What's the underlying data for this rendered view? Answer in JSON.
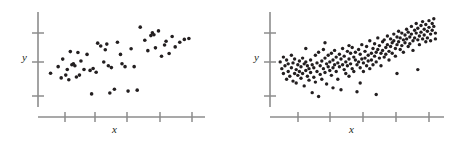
{
  "figure": {
    "title": "",
    "background": "#ffffff",
    "point_color": "#231f20",
    "axis_color": "#8c8c8c"
  },
  "chart_data": [
    {
      "type": "scatter",
      "name": "left-panel",
      "title": "",
      "xlabel": "x",
      "ylabel": "y",
      "xlim": [
        0,
        100
      ],
      "ylim": [
        0,
        100
      ],
      "grid": false,
      "legend": null,
      "n_points": 55,
      "x_ticks": [
        16,
        33,
        50,
        67,
        84
      ],
      "x_tick_labels": [
        "",
        "",
        "",
        "",
        ""
      ],
      "y_ticks": [
        22,
        52,
        82
      ],
      "y_tick_labels": [
        "",
        "",
        ""
      ],
      "points": [
        [
          3,
          37
        ],
        [
          8,
          44
        ],
        [
          10,
          32
        ],
        [
          11,
          52
        ],
        [
          13,
          35
        ],
        [
          14,
          41
        ],
        [
          15,
          30
        ],
        [
          16,
          60
        ],
        [
          17,
          46
        ],
        [
          18,
          47
        ],
        [
          19,
          45
        ],
        [
          20,
          33
        ],
        [
          21,
          59
        ],
        [
          22,
          35
        ],
        [
          23,
          50
        ],
        [
          25,
          41
        ],
        [
          27,
          57
        ],
        [
          29,
          40
        ],
        [
          30,
          15
        ],
        [
          31,
          42
        ],
        [
          33,
          38
        ],
        [
          34,
          69
        ],
        [
          36,
          66
        ],
        [
          38,
          49
        ],
        [
          39,
          62
        ],
        [
          40,
          68
        ],
        [
          41,
          45
        ],
        [
          42,
          16
        ],
        [
          43,
          43
        ],
        [
          45,
          20
        ],
        [
          47,
          70
        ],
        [
          49,
          57
        ],
        [
          50,
          47
        ],
        [
          52,
          44
        ],
        [
          54,
          18
        ],
        [
          56,
          63
        ],
        [
          58,
          44
        ],
        [
          60,
          19
        ],
        [
          62,
          86
        ],
        [
          65,
          72
        ],
        [
          67,
          61
        ],
        [
          69,
          77
        ],
        [
          70,
          80
        ],
        [
          71,
          78
        ],
        [
          72,
          64
        ],
        [
          74,
          82
        ],
        [
          76,
          55
        ],
        [
          78,
          67
        ],
        [
          79,
          71
        ],
        [
          81,
          58
        ],
        [
          83,
          76
        ],
        [
          85,
          65
        ],
        [
          88,
          70
        ],
        [
          91,
          73
        ],
        [
          94,
          74
        ]
      ]
    },
    {
      "type": "scatter",
      "name": "right-panel",
      "title": "",
      "xlabel": "x",
      "ylabel": "y",
      "xlim": [
        0,
        100
      ],
      "ylim": [
        0,
        100
      ],
      "grid": false,
      "legend": null,
      "n_points": 200,
      "x_ticks": [
        16,
        33,
        50,
        67,
        84
      ],
      "x_tick_labels": [
        "",
        "",
        "",
        "",
        ""
      ],
      "y_ticks": [
        22,
        52,
        82
      ],
      "y_tick_labels": [
        "",
        "",
        ""
      ],
      "points": [
        [
          2,
          48
        ],
        [
          3,
          41
        ],
        [
          4,
          36
        ],
        [
          4,
          53
        ],
        [
          5,
          44
        ],
        [
          6,
          30
        ],
        [
          6,
          50
        ],
        [
          7,
          38
        ],
        [
          7,
          46
        ],
        [
          8,
          33
        ],
        [
          9,
          42
        ],
        [
          9,
          55
        ],
        [
          10,
          28
        ],
        [
          10,
          47
        ],
        [
          11,
          36
        ],
        [
          11,
          51
        ],
        [
          12,
          40
        ],
        [
          12,
          26
        ],
        [
          13,
          45
        ],
        [
          13,
          34
        ],
        [
          14,
          49
        ],
        [
          14,
          38
        ],
        [
          15,
          31
        ],
        [
          15,
          43
        ],
        [
          16,
          52
        ],
        [
          16,
          36
        ],
        [
          17,
          46
        ],
        [
          17,
          23
        ],
        [
          18,
          39
        ],
        [
          18,
          48
        ],
        [
          19,
          33
        ],
        [
          19,
          44
        ],
        [
          20,
          41
        ],
        [
          20,
          29
        ],
        [
          21,
          50
        ],
        [
          21,
          37
        ],
        [
          22,
          16
        ],
        [
          22,
          45
        ],
        [
          23,
          32
        ],
        [
          23,
          42
        ],
        [
          24,
          55
        ],
        [
          24,
          27
        ],
        [
          25,
          47
        ],
        [
          25,
          38
        ],
        [
          26,
          12
        ],
        [
          26,
          58
        ],
        [
          27,
          44
        ],
        [
          27,
          35
        ],
        [
          28,
          49
        ],
        [
          28,
          30
        ],
        [
          29,
          41
        ],
        [
          29,
          61
        ],
        [
          30,
          52
        ],
        [
          30,
          37
        ],
        [
          31,
          46
        ],
        [
          31,
          25
        ],
        [
          32,
          43
        ],
        [
          32,
          55
        ],
        [
          33,
          39
        ],
        [
          33,
          48
        ],
        [
          34,
          57
        ],
        [
          34,
          34
        ],
        [
          35,
          50
        ],
        [
          35,
          42
        ],
        [
          36,
          60
        ],
        [
          36,
          45
        ],
        [
          37,
          38
        ],
        [
          37,
          53
        ],
        [
          38,
          47
        ],
        [
          38,
          30
        ],
        [
          39,
          56
        ],
        [
          39,
          43
        ],
        [
          40,
          19
        ],
        [
          40,
          51
        ],
        [
          41,
          45
        ],
        [
          41,
          62
        ],
        [
          42,
          40
        ],
        [
          42,
          54
        ],
        [
          43,
          48
        ],
        [
          43,
          36
        ],
        [
          44,
          59
        ],
        [
          44,
          44
        ],
        [
          45,
          51
        ],
        [
          45,
          33
        ],
        [
          46,
          57
        ],
        [
          46,
          46
        ],
        [
          47,
          41
        ],
        [
          47,
          63
        ],
        [
          48,
          53
        ],
        [
          48,
          38
        ],
        [
          49,
          50
        ],
        [
          49,
          58
        ],
        [
          50,
          45
        ],
        [
          50,
          17
        ],
        [
          51,
          61
        ],
        [
          51,
          48
        ],
        [
          52,
          42
        ],
        [
          52,
          56
        ],
        [
          53,
          51
        ],
        [
          53,
          66
        ],
        [
          54,
          47
        ],
        [
          54,
          38
        ],
        [
          55,
          59
        ],
        [
          55,
          52
        ],
        [
          56,
          44
        ],
        [
          56,
          64
        ],
        [
          57,
          55
        ],
        [
          57,
          49
        ],
        [
          58,
          41
        ],
        [
          58,
          70
        ],
        [
          59,
          57
        ],
        [
          59,
          50
        ],
        [
          60,
          62
        ],
        [
          60,
          45
        ],
        [
          61,
          54
        ],
        [
          61,
          67
        ],
        [
          62,
          58
        ],
        [
          62,
          48
        ],
        [
          63,
          73
        ],
        [
          63,
          61
        ],
        [
          64,
          52
        ],
        [
          64,
          65
        ],
        [
          65,
          57
        ],
        [
          65,
          44
        ],
        [
          66,
          69
        ],
        [
          66,
          60
        ],
        [
          67,
          53
        ],
        [
          67,
          71
        ],
        [
          68,
          63
        ],
        [
          68,
          56
        ],
        [
          69,
          75
        ],
        [
          69,
          66
        ],
        [
          70,
          59
        ],
        [
          70,
          50
        ],
        [
          71,
          72
        ],
        [
          71,
          64
        ],
        [
          72,
          68
        ],
        [
          72,
          57
        ],
        [
          73,
          77
        ],
        [
          73,
          70
        ],
        [
          74,
          62
        ],
        [
          74,
          54
        ],
        [
          75,
          74
        ],
        [
          75,
          66
        ],
        [
          76,
          80
        ],
        [
          76,
          69
        ],
        [
          77,
          61
        ],
        [
          77,
          73
        ],
        [
          78,
          78
        ],
        [
          78,
          65
        ],
        [
          79,
          71
        ],
        [
          79,
          58
        ],
        [
          80,
          76
        ],
        [
          80,
          68
        ],
        [
          81,
          82
        ],
        [
          81,
          72
        ],
        [
          82,
          64
        ],
        [
          82,
          79
        ],
        [
          83,
          74
        ],
        [
          83,
          67
        ],
        [
          84,
          85
        ],
        [
          84,
          77
        ],
        [
          85,
          70
        ],
        [
          85,
          60
        ],
        [
          86,
          81
        ],
        [
          86,
          73
        ],
        [
          87,
          88
        ],
        [
          87,
          78
        ],
        [
          88,
          71
        ],
        [
          88,
          83
        ],
        [
          89,
          75
        ],
        [
          89,
          66
        ],
        [
          90,
          86
        ],
        [
          90,
          79
        ],
        [
          91,
          72
        ],
        [
          91,
          90
        ],
        [
          92,
          82
        ],
        [
          92,
          76
        ],
        [
          93,
          69
        ],
        [
          93,
          87
        ],
        [
          94,
          80
        ],
        [
          94,
          73
        ],
        [
          95,
          91
        ],
        [
          95,
          84
        ],
        [
          96,
          77
        ],
        [
          96,
          70
        ],
        [
          97,
          88
        ],
        [
          97,
          81
        ],
        [
          98,
          93
        ],
        [
          98,
          85
        ],
        [
          99,
          78
        ],
        [
          99,
          72
        ],
        [
          62,
          14
        ],
        [
          75,
          36
        ],
        [
          88,
          40
        ],
        [
          45,
          65
        ],
        [
          30,
          68
        ],
        [
          18,
          62
        ],
        [
          52,
          26
        ],
        [
          35,
          21
        ]
      ]
    }
  ]
}
